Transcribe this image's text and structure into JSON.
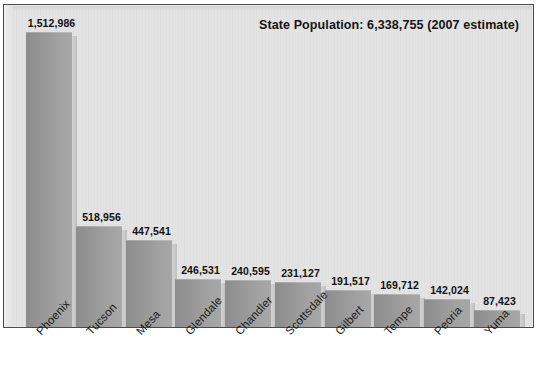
{
  "chart_data": {
    "type": "bar",
    "title": "State Population: 6,338,755 (2007 estimate)",
    "xlabel": "",
    "ylabel": "",
    "grid": false,
    "legend": "none",
    "ylim": [
      0,
      1512986
    ],
    "categories": [
      "Phoenix",
      "Tucson",
      "Mesa",
      "Glendale",
      "Chandler",
      "Scottsdale",
      "Gilbert",
      "Tempe",
      "Peoria",
      "Yuma"
    ],
    "values": [
      1512986,
      518956,
      447541,
      246531,
      240595,
      231127,
      191517,
      169712,
      142024,
      87423
    ],
    "value_labels": [
      "1,512,986",
      "518,956",
      "447,541",
      "246,531",
      "240,595",
      "231,127",
      "191,517",
      "169,712",
      "142,024",
      "87,423"
    ],
    "annotations": []
  },
  "title": {
    "text": "State Population: 6,338,755 (2007 estimate)"
  },
  "colors": {
    "panel_background": "#e4e4e4",
    "panel_border": "#4a4a4a",
    "bar_dark": "#8d8d8d",
    "bar_light": "#a7a7a7",
    "bar_highlight": "#c9c9c9",
    "label_text": "#111111",
    "page_background": "#ffffff"
  }
}
